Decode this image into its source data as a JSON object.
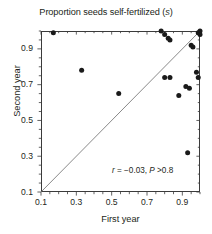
{
  "chart_data": {
    "type": "scatter",
    "title": "Proportion seeds self-fertilized (s)",
    "title_plain": "Proportion seeds self-fertilized",
    "title_italic_symbol": "s",
    "xlabel": "First year",
    "ylabel": "Second year",
    "xlim": [
      0.1,
      1.0
    ],
    "ylim": [
      0.1,
      1.0
    ],
    "grid": false,
    "legend": null,
    "xticks": [
      0.1,
      0.3,
      0.5,
      0.7,
      0.9
    ],
    "xtick_labels": [
      "0.1",
      "0.3",
      "0.5",
      "0.7",
      "0.9"
    ],
    "yticks": [
      0.1,
      0.3,
      0.5,
      0.7,
      0.9
    ],
    "ytick_labels": [
      "0.1",
      "0.3",
      "0.5",
      "0.7",
      "0.9"
    ],
    "minor_tick_step": 0.05,
    "annotation": "r = −0.03, P >0.8",
    "annotation_parts": {
      "r_symbol": "r",
      "r_value": " = −0.03, ",
      "p_symbol": "P",
      "p_value": " >0.8"
    },
    "reference_line": {
      "label": "1:1 line",
      "from": [
        0.1,
        0.1
      ],
      "to": [
        1.0,
        1.0
      ]
    },
    "marker": {
      "shape": "circle",
      "color": "#1a1a1a",
      "size_px": 5
    },
    "x": [
      0.17,
      0.33,
      0.54,
      0.78,
      0.8,
      0.82,
      0.83,
      0.8,
      0.83,
      0.88,
      0.92,
      0.94,
      0.93,
      0.95,
      0.96,
      0.98,
      0.99,
      0.99,
      1.0,
      1.0
    ],
    "y": [
      0.99,
      0.78,
      0.65,
      1.0,
      0.98,
      0.96,
      0.95,
      0.74,
      0.74,
      0.64,
      0.69,
      0.68,
      0.32,
      0.92,
      0.91,
      0.77,
      0.74,
      0.99,
      1.0,
      0.98
    ],
    "points": [
      {
        "x": 0.17,
        "y": 0.99
      },
      {
        "x": 0.33,
        "y": 0.78
      },
      {
        "x": 0.54,
        "y": 0.65
      },
      {
        "x": 0.78,
        "y": 1.0
      },
      {
        "x": 0.8,
        "y": 0.98
      },
      {
        "x": 0.82,
        "y": 0.96
      },
      {
        "x": 0.83,
        "y": 0.95
      },
      {
        "x": 0.8,
        "y": 0.74
      },
      {
        "x": 0.83,
        "y": 0.74
      },
      {
        "x": 0.88,
        "y": 0.64
      },
      {
        "x": 0.92,
        "y": 0.69
      },
      {
        "x": 0.94,
        "y": 0.68
      },
      {
        "x": 0.93,
        "y": 0.32
      },
      {
        "x": 0.95,
        "y": 0.92
      },
      {
        "x": 0.96,
        "y": 0.91
      },
      {
        "x": 0.98,
        "y": 0.77
      },
      {
        "x": 0.99,
        "y": 0.74
      },
      {
        "x": 0.99,
        "y": 0.99
      },
      {
        "x": 1.0,
        "y": 1.0
      },
      {
        "x": 1.0,
        "y": 0.98
      }
    ]
  },
  "colors": {
    "axis": "#3b3b3b",
    "text": "#231f20",
    "marker": "#1a1a1a",
    "reference_line": "#6b6b6b",
    "background": "#ffffff"
  }
}
